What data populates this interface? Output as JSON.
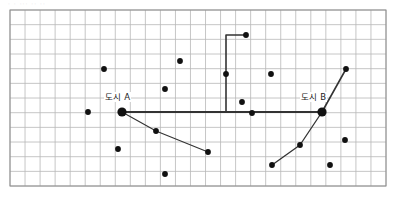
{
  "figure": {
    "name": "grid-map-with-two-cities",
    "type": "diagram",
    "top_cropped_text": "· · ··· ·· ··",
    "background_color": "#ffffff",
    "frame_color": "#8c8c8c",
    "grid_color": "#b7b7b7",
    "point_color": "#111111",
    "route_color": "#333333"
  },
  "grid": {
    "x": 10,
    "y": 10,
    "width": 376,
    "height": 176,
    "columns": 25,
    "rows": 12,
    "cell_width": 15.04,
    "cell_height": 14.67
  },
  "labels": [
    {
      "id": "city-a",
      "text": "도시 A",
      "x": 104,
      "y": 92
    },
    {
      "id": "city-b",
      "text": "도시 B",
      "x": 300,
      "y": 92
    }
  ],
  "nodes": [
    {
      "id": "city-a",
      "label": "도시 A",
      "x": 122,
      "y": 112,
      "r": 4.6,
      "emphasis": true
    },
    {
      "id": "city-b",
      "label": "도시 B",
      "x": 322,
      "y": 112,
      "r": 4.6,
      "emphasis": true
    },
    {
      "id": "p01",
      "label": "",
      "x": 246,
      "y": 35,
      "r": 2.9,
      "emphasis": false
    },
    {
      "id": "p02",
      "label": "",
      "x": 180,
      "y": 61,
      "r": 2.9,
      "emphasis": false
    },
    {
      "id": "p03",
      "label": "",
      "x": 104,
      "y": 69,
      "r": 2.9,
      "emphasis": false
    },
    {
      "id": "p04",
      "label": "",
      "x": 226,
      "y": 74,
      "r": 2.9,
      "emphasis": false
    },
    {
      "id": "p05",
      "label": "",
      "x": 271,
      "y": 74,
      "r": 2.9,
      "emphasis": false
    },
    {
      "id": "p06",
      "label": "",
      "x": 346,
      "y": 69,
      "r": 2.9,
      "emphasis": false
    },
    {
      "id": "p07",
      "label": "",
      "x": 165,
      "y": 89,
      "r": 2.9,
      "emphasis": false
    },
    {
      "id": "p08",
      "label": "",
      "x": 242,
      "y": 102,
      "r": 2.9,
      "emphasis": false
    },
    {
      "id": "p09",
      "label": "",
      "x": 88,
      "y": 112,
      "r": 2.9,
      "emphasis": false
    },
    {
      "id": "p10",
      "label": "",
      "x": 252,
      "y": 113,
      "r": 2.9,
      "emphasis": false
    },
    {
      "id": "p11",
      "label": "",
      "x": 156,
      "y": 131,
      "r": 2.9,
      "emphasis": false
    },
    {
      "id": "p12",
      "label": "",
      "x": 118,
      "y": 149,
      "r": 2.9,
      "emphasis": false
    },
    {
      "id": "p13",
      "label": "",
      "x": 208,
      "y": 152,
      "r": 2.9,
      "emphasis": false
    },
    {
      "id": "p14",
      "label": "",
      "x": 300,
      "y": 145,
      "r": 2.9,
      "emphasis": false
    },
    {
      "id": "p15",
      "label": "",
      "x": 345,
      "y": 140,
      "r": 2.9,
      "emphasis": false
    },
    {
      "id": "p16",
      "label": "",
      "x": 272,
      "y": 165,
      "r": 2.9,
      "emphasis": false
    },
    {
      "id": "p17",
      "label": "",
      "x": 330,
      "y": 165,
      "r": 2.9,
      "emphasis": false
    },
    {
      "id": "p18",
      "label": "",
      "x": 165,
      "y": 174,
      "r": 2.9,
      "emphasis": false
    }
  ],
  "routes": [
    {
      "id": "route-main",
      "from": "city-a",
      "to": "city-b",
      "width": 2.0,
      "points": "122,112 322,112"
    },
    {
      "id": "route-north-branch",
      "from": "route-main",
      "to": "p01",
      "width": 1.6,
      "points": "226,112 226,35 246,35"
    },
    {
      "id": "route-southwest",
      "from": "city-a",
      "to": "p13",
      "width": 1.1,
      "points": "122,112 156,131 208,152"
    },
    {
      "id": "route-northeast",
      "from": "city-b",
      "to": "p06",
      "width": 1.6,
      "points": "322,112 346,69"
    },
    {
      "id": "route-south-branch",
      "from": "city-b",
      "to": "p16",
      "width": 1.3,
      "points": "322,112 300,145 272,165"
    }
  ]
}
